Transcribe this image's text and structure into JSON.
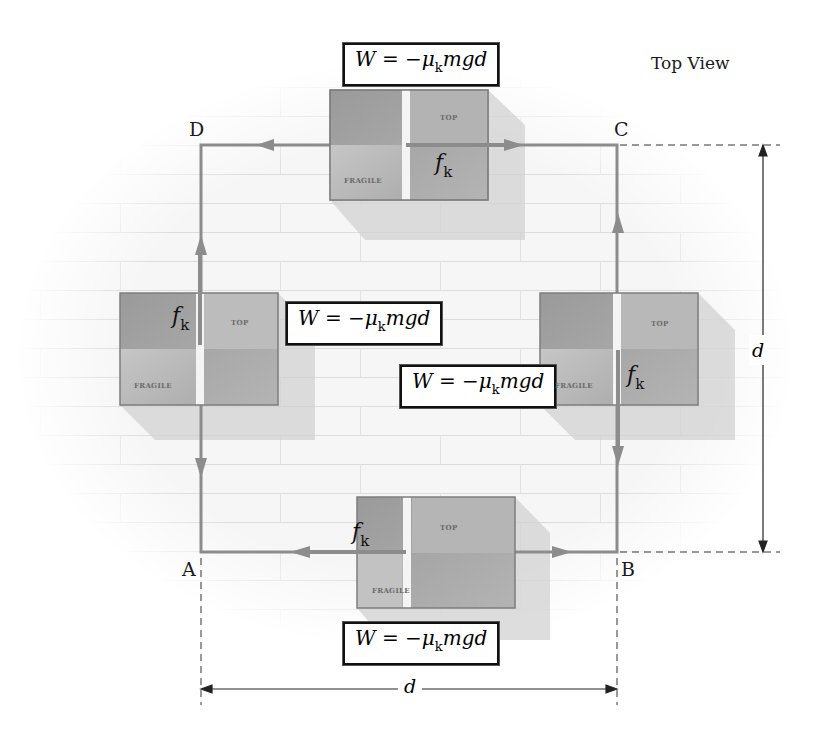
{
  "title": "Top View",
  "points": {
    "A": "A",
    "B": "B",
    "C": "C",
    "D": "D"
  },
  "work_equation": {
    "lhs": "W",
    "equals": " = −",
    "mu": "μ",
    "sub": "k",
    "rest": "mgd"
  },
  "equations": [
    {
      "id": "top",
      "text": "W = −μkmgd"
    },
    {
      "id": "left",
      "text": "W = −μkmgd"
    },
    {
      "id": "right",
      "text": "W = −μkmgd"
    },
    {
      "id": "bottom",
      "text": "W = −μkmgd"
    }
  ],
  "friction_label": {
    "symbol": "f",
    "sub": "k"
  },
  "box_labels": {
    "top": "TOP",
    "fragile": "FRAGILE"
  },
  "dimensions": {
    "horizontal": "d",
    "vertical": "d"
  },
  "colors": {
    "path": "#8c8c8c",
    "box_dark": "#a3a3a3",
    "box_light": "#bdbdbd",
    "box_border": "#7d7d7d",
    "tape": "#f4f4f4",
    "floor_line": "#d9d9d9"
  }
}
